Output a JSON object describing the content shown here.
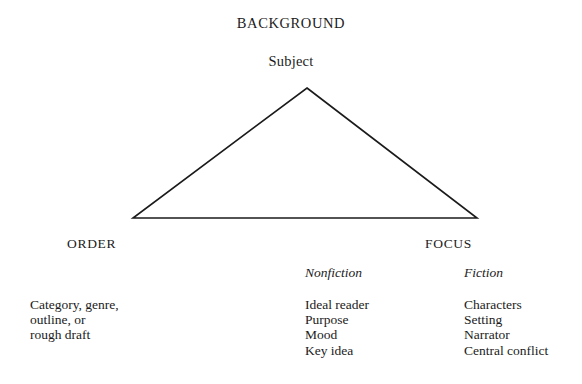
{
  "diagram": {
    "apex": {
      "title": "BACKGROUND",
      "subtitle": "Subject"
    },
    "vertices": {
      "left": "ORDER",
      "right": "FOCUS"
    },
    "triangle": {
      "stroke_color": "#1b1b1b",
      "stroke_width": 1.6,
      "apex_x": 307,
      "apex_y": 88,
      "left_x": 133,
      "left_y": 218,
      "right_x": 477,
      "right_y": 218
    },
    "columns": [
      {
        "name": "order",
        "header": "",
        "items": "Category, genre,\noutline, or\nrough draft"
      },
      {
        "name": "nonfiction",
        "header": "Nonfiction",
        "items": "Ideal reader\nPurpose\nMood\nKey idea"
      },
      {
        "name": "fiction",
        "header": "Fiction",
        "items": "Characters\nSetting\nNarrator\nCentral conflict"
      }
    ]
  }
}
